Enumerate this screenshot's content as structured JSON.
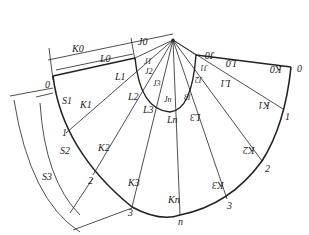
{
  "diagram": {
    "type": "sheet-metal development (unfolding) of oblique cone transition",
    "apex_label": "",
    "labels": {
      "K0_top": "K0",
      "L0_top": "L0",
      "J0_top": "J0",
      "J1": "J1",
      "J2": "J2",
      "J3": "J3",
      "Jn": "Jn",
      "L1": "L1",
      "L2": "L2",
      "L3": "L3",
      "Ln": "Ln",
      "K1": "K1",
      "K2": "K2",
      "K3": "K3",
      "Kn": "Kn",
      "S1": "S1",
      "S2": "S2",
      "S3": "S3",
      "pt0_left": "0",
      "pt1_left": "1",
      "pt2_left": "2",
      "pt3_left": "3",
      "ptn": "n",
      "pt3_right": "3",
      "pt2_right": "2",
      "pt1_right": "1",
      "pt0_right": "0",
      "J0_right": "J0",
      "L0_right": "L0",
      "K0_right": "K0",
      "J1_right": "J1",
      "J2_right": "J2",
      "J3_right": "J3",
      "L1_right": "L1",
      "L3_right": "L3",
      "K1_right": "K1",
      "K2_right": "K2",
      "K3_right": "K3"
    },
    "colors": {
      "line": "#222222",
      "background": "#ffffff"
    }
  }
}
